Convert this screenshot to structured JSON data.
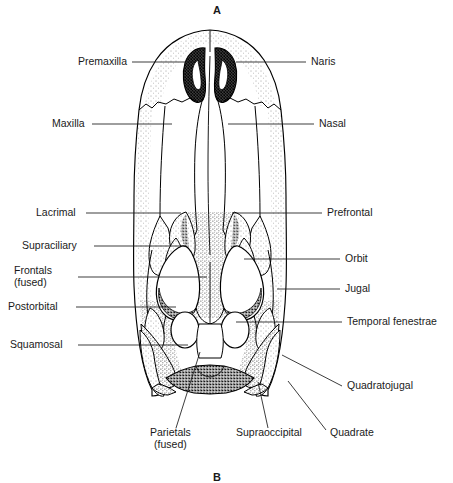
{
  "figure": {
    "kind": "anatomical-line-drawing",
    "panel_top_letter": "A",
    "panel_bottom_letter": "B",
    "ink_color": "#000000",
    "background_color": "#ffffff"
  },
  "labels": {
    "premaxilla": "Premaxilla",
    "maxilla": "Maxilla",
    "lacrimal": "Lacrimal",
    "supraciliary": "Supraciliary",
    "frontals_line1": "Frontals",
    "frontals_line2": "(fused)",
    "postorbital": "Postorbital",
    "squamosal": "Squamosal",
    "naris": "Naris",
    "nasal": "Nasal",
    "prefrontal": "Prefrontal",
    "orbit": "Orbit",
    "jugal": "Jugal",
    "temporal_fenestrae": "Temporal fenestrae",
    "quadratojugal": "Quadratojugal",
    "parietals_line1": "Parietals",
    "parietals_line2": "(fused)",
    "supraoccipital": "Supraoccipital",
    "quadrate": "Quadrate"
  }
}
